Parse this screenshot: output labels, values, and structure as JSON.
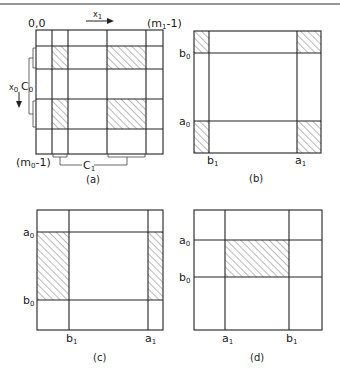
{
  "figure": {
    "top_rule": true,
    "panels": [
      {
        "id": "a",
        "caption": "(a)",
        "labels": {
          "origin": "0,0",
          "x1_axis": "x",
          "x1_axis_sub": "1",
          "x0_axis": "x",
          "x0_axis_sub": "0",
          "top_right": "(m",
          "top_right_sub": "1",
          "top_right_tail": "-1)",
          "bottom_left": "(m",
          "bottom_left_sub": "0",
          "bottom_left_tail": "-1)",
          "c0": "C",
          "c0_sub": "0",
          "c1": "C",
          "c1_sub": "1"
        }
      },
      {
        "id": "b",
        "caption": "(b)",
        "labels": {
          "b0": "b",
          "b0_sub": "0",
          "a0": "a",
          "a0_sub": "0",
          "b1": "b",
          "b1_sub": "1",
          "a1": "a",
          "a1_sub": "1"
        }
      },
      {
        "id": "c",
        "caption": "(c)",
        "labels": {
          "a0": "a",
          "a0_sub": "0",
          "b0": "b",
          "b0_sub": "0",
          "b1": "b",
          "b1_sub": "1",
          "a1": "a",
          "a1_sub": "1"
        }
      },
      {
        "id": "d",
        "caption": "(d)",
        "labels": {
          "a0": "a",
          "a0_sub": "0",
          "b0": "b",
          "b0_sub": "0",
          "a1": "a",
          "a1_sub": "1",
          "b1": "b",
          "b1_sub": "1"
        }
      }
    ]
  }
}
